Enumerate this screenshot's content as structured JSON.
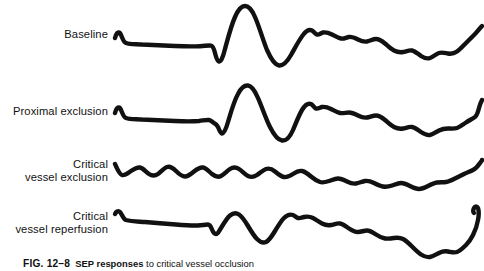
{
  "figure": {
    "caption": {
      "number": "FIG. 12–8",
      "lead_term": "SEP responses",
      "text": "to critical vessel occlusion"
    },
    "stroke_color": "#111111",
    "background_color": "#ffffff",
    "traces": [
      {
        "id": "baseline",
        "label_lines": [
          "Baseline"
        ],
        "description": "Large biphasic evoked response with prominent positive peak followed by deep negative trough, then damped oscillations decaying to the right.",
        "amplitude": "large"
      },
      {
        "id": "proximal-exclusion",
        "label_lines": [
          "Proximal exclusion"
        ],
        "description": "Evoked response preserved, slightly reduced amplitude compared with baseline, followed by damped oscillations.",
        "amplitude": "large"
      },
      {
        "id": "critical-vessel-exclusion",
        "label_lines": [
          "Critical",
          "vessel exclusion"
        ],
        "description": "Evoked response abolished; trace is a low-amplitude noisy flat line throughout.",
        "amplitude": "flat"
      },
      {
        "id": "critical-vessel-reperfusion",
        "label_lines": [
          "Critical",
          "vessel reperfusion"
        ],
        "description": "Evoked response partially recovered with reduced amplitude peaks, followed by damped oscillations.",
        "amplitude": "medium"
      }
    ]
  }
}
